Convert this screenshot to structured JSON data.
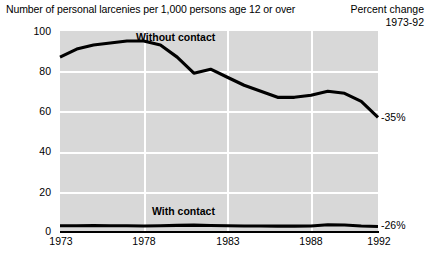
{
  "header": {
    "title_left": "Number of personal larcenies per 1,000 persons age 12 or over",
    "title_right_line1": "Percent change",
    "title_right_line2": "1973-92"
  },
  "annotations": {
    "without_contact_pct": "-35%",
    "with_contact_pct": "-26%"
  },
  "chart_data": {
    "type": "line",
    "title": "Number of personal larcenies per 1,000 persons age 12 or over",
    "subtitle": "Percent change 1973-92",
    "xlabel": "",
    "ylabel": "Number of personal larcenies per 1,000 persons age 12 or over",
    "xlim": [
      1973,
      1992
    ],
    "ylim": [
      0,
      100
    ],
    "yticks": [
      0,
      20,
      40,
      60,
      80,
      100
    ],
    "ytick_labels": [
      "0",
      "20",
      "40",
      "60",
      "80",
      "100"
    ],
    "xticks": [
      1973,
      1978,
      1983,
      1988,
      1992
    ],
    "xtick_labels": [
      "1973",
      "1978",
      "1983",
      "1988",
      "1992"
    ],
    "gridlines": {
      "horizontal_at": [
        20,
        40,
        60,
        80,
        100
      ],
      "vertical_at": [
        1978,
        1983,
        1988
      ]
    },
    "plot_background": "#d8d8d8",
    "gridline_color": "#ffffff",
    "line_color": "#000000",
    "legend_position": "inline-labels",
    "x": [
      1973,
      1974,
      1975,
      1976,
      1977,
      1978,
      1979,
      1980,
      1981,
      1982,
      1983,
      1984,
      1985,
      1986,
      1987,
      1988,
      1989,
      1990,
      1991,
      1992
    ],
    "series": [
      {
        "name": "Without contact",
        "label": "Without contact",
        "percent_change": "-35%",
        "values": [
          87,
          91,
          93,
          94,
          95,
          95,
          93,
          87,
          79,
          81,
          77,
          73,
          70,
          67,
          67,
          68,
          70,
          69,
          65,
          57
        ]
      },
      {
        "name": "With contact",
        "label": "With contact",
        "percent_change": "-26%",
        "values": [
          3.1,
          3.1,
          3.2,
          3.1,
          3.1,
          3.0,
          3.1,
          3.3,
          3.4,
          3.2,
          3.1,
          3.0,
          3.0,
          2.9,
          2.9,
          3.0,
          3.6,
          3.5,
          3.0,
          2.7
        ]
      }
    ]
  }
}
